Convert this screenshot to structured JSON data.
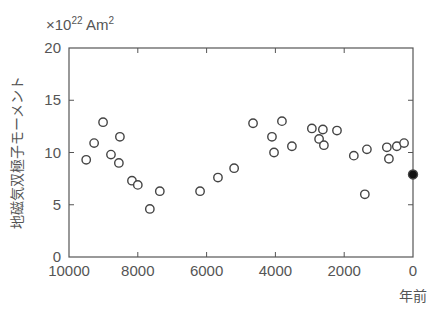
{
  "chart_data": {
    "type": "scatter",
    "title": "",
    "unit_label_prefix": "×10",
    "unit_label_exp": "22",
    "unit_label_suffix": " Am",
    "unit_label_sq": "2",
    "xlabel": "年前",
    "ylabel": "地磁気双極子モーメント",
    "xlim": [
      10000,
      0
    ],
    "ylim": [
      0,
      20
    ],
    "x_ticks": [
      10000,
      8000,
      6000,
      4000,
      2000,
      0
    ],
    "y_ticks": [
      0,
      5,
      10,
      15,
      20
    ],
    "grid": false,
    "series": [
      {
        "name": "past",
        "marker": "open-circle",
        "points": [
          [
            9500,
            9.3
          ],
          [
            9270,
            10.9
          ],
          [
            9010,
            12.9
          ],
          [
            8780,
            9.8
          ],
          [
            8550,
            9.0
          ],
          [
            8520,
            11.5
          ],
          [
            8170,
            7.3
          ],
          [
            8000,
            6.9
          ],
          [
            7650,
            4.6
          ],
          [
            7360,
            6.3
          ],
          [
            6190,
            6.3
          ],
          [
            5670,
            7.6
          ],
          [
            5200,
            8.5
          ],
          [
            4650,
            12.8
          ],
          [
            4100,
            11.5
          ],
          [
            4040,
            10.0
          ],
          [
            3810,
            13.0
          ],
          [
            3520,
            10.6
          ],
          [
            2940,
            12.3
          ],
          [
            2620,
            12.2
          ],
          [
            2730,
            11.3
          ],
          [
            2590,
            10.7
          ],
          [
            2210,
            12.1
          ],
          [
            1720,
            9.7
          ],
          [
            1340,
            10.3
          ],
          [
            1400,
            6.0
          ],
          [
            760,
            10.5
          ],
          [
            700,
            9.4
          ],
          [
            470,
            10.6
          ],
          [
            260,
            10.9
          ]
        ]
      },
      {
        "name": "present",
        "marker": "filled-circle",
        "points": [
          [
            0,
            7.9
          ]
        ]
      }
    ]
  },
  "colors": {
    "axis": "#555555",
    "marker": "#444444"
  }
}
